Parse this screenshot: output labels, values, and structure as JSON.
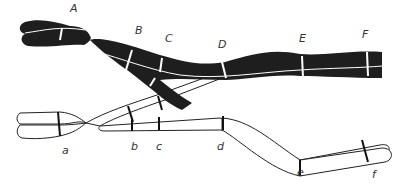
{
  "diagram": {
    "upper_chromosome": {
      "fill": "#1e1e1e",
      "labels": [
        "A",
        "B",
        "C",
        "D",
        "E",
        "F"
      ]
    },
    "lower_chromosome": {
      "fill": "#ffffff",
      "labels": [
        "a",
        "b",
        "c",
        "d",
        "e",
        "f"
      ]
    }
  }
}
